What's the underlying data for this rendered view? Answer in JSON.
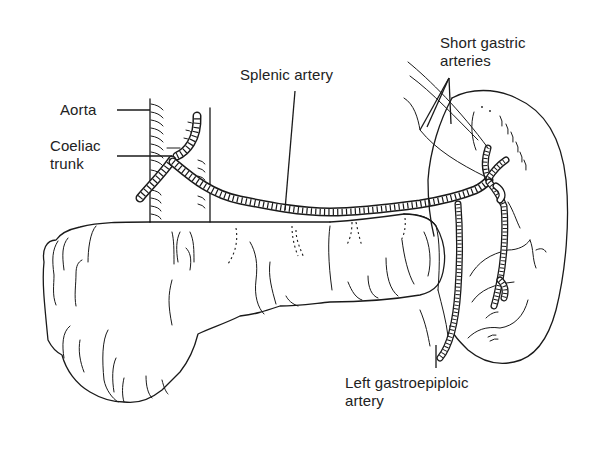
{
  "figure": {
    "type": "anatomical line drawing"
  },
  "labels": {
    "aorta": "Aorta",
    "coeliac_line1": "Coeliac",
    "coeliac_line2": "trunk",
    "splenic_artery": "Splenic artery",
    "short_gastric_line1": "Short gastric",
    "short_gastric_line2": "arteries",
    "left_gastroepiploic_line1": "Left gastroepiploic",
    "left_gastroepiploic_line2": "artery"
  },
  "structures": [
    "aorta",
    "coeliac-trunk",
    "splenic-artery",
    "pancreas",
    "spleen",
    "short-gastric-arteries",
    "left-gastroepiploic-artery"
  ],
  "colors": {
    "ink": "#1a1a1a",
    "background": "#ffffff"
  }
}
